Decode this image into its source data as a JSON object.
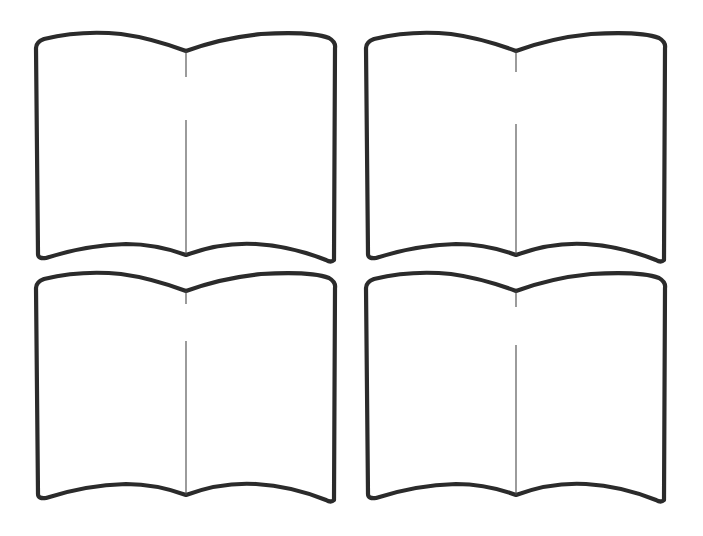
{
  "page": {
    "title": "",
    "background": "#ffffff"
  },
  "colors": {
    "outline": "#2b2b2b",
    "spine": "#4a4a4a",
    "page_fill": "#ffffff"
  },
  "books": [
    {
      "id": "book-top-left",
      "x": 26,
      "y": 22,
      "spine_gap": [
        57,
        98
      ]
    },
    {
      "id": "book-top-right",
      "x": 356,
      "y": 22,
      "spine_gap": [
        28,
        102
      ]
    },
    {
      "id": "book-bottom-left",
      "x": 26,
      "y": 262,
      "spine_gap": [
        42,
        79
      ]
    },
    {
      "id": "book-bottom-right",
      "x": 356,
      "y": 262,
      "spine_gap": [
        45,
        83
      ]
    }
  ]
}
